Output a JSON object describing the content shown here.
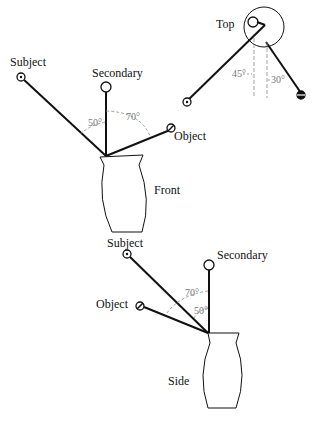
{
  "diagram": {
    "front": {
      "view_label": "Front",
      "subject_label": "Subject",
      "secondary_label": "Secondary",
      "object_label": "Object",
      "angle_subject": "50°",
      "angle_object": "70°"
    },
    "top": {
      "view_label": "Top",
      "angle_left": "45°",
      "angle_right": "30°"
    },
    "side": {
      "view_label": "Side",
      "subject_label": "Subject",
      "secondary_label": "Secondary",
      "object_label": "Object",
      "angle_subject": "50°",
      "angle_object": "70°"
    },
    "colors": {
      "line": "#111111",
      "dashed": "#888888",
      "label": "#111111"
    }
  }
}
